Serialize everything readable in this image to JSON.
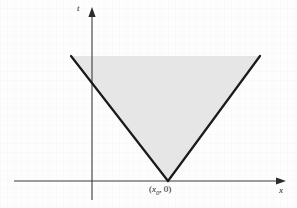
{
  "figure": {
    "type": "math-diagram",
    "background_color": "#fdfdfd",
    "ink_color": "#1a1a1a",
    "shade_color": "#e6e6e6",
    "axes": {
      "horizontal": {
        "name": "x",
        "label": "x",
        "label_style": "italic",
        "arrow": "right",
        "y_pixel": 181,
        "x_start_pixel": 14,
        "x_end_pixel": 285
      },
      "vertical": {
        "name": "t",
        "label": "t",
        "label_style": "italic",
        "arrow": "up",
        "x_pixel": 92,
        "y_top_pixel": 8,
        "y_bottom_pixel": 200
      }
    },
    "region": {
      "name": "shaded-cone",
      "shape": "inverted-triangle",
      "fill": "#e6e6e6",
      "stroke": "#1a1a1a",
      "stroke_width": 2.2,
      "apex": {
        "x": 168,
        "y": 181
      },
      "top_left": {
        "x": 71,
        "y": 56
      },
      "top_right": {
        "x": 260,
        "y": 56
      },
      "open_top": true
    },
    "annotations": [
      {
        "name": "apex-point-label",
        "open_paren": "(",
        "variable": "x",
        "subscript": "0",
        "comma": ", ",
        "value": "0",
        "close_paren": ")",
        "full_text": "(x0, 0)",
        "x_pixel": 149,
        "y_pixel": 185
      }
    ]
  },
  "chart_data": {
    "type": "area",
    "title": "",
    "xlabel": "x",
    "ylabel": "t",
    "grid": false,
    "legend": null,
    "annotations": [
      "(x0, 0)"
    ],
    "series": [
      {
        "name": "cone-left-edge",
        "points": [
          [
            168,
            0
          ],
          [
            71,
            125
          ]
        ]
      },
      {
        "name": "cone-right-edge",
        "points": [
          [
            168,
            0
          ],
          [
            260,
            125
          ]
        ]
      }
    ],
    "shaded_region": {
      "name": "cone",
      "vertices": [
        [
          168,
          0
        ],
        [
          71,
          125
        ],
        [
          260,
          125
        ]
      ],
      "fill": "#e6e6e6"
    },
    "note": "Coordinates given in pixel space relative to the origin at the axes crossing."
  }
}
